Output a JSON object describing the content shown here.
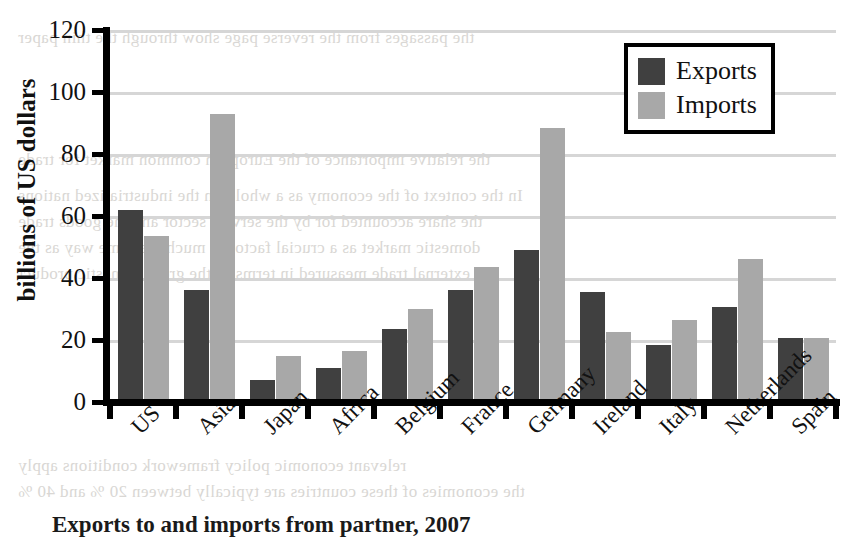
{
  "chart_data": {
    "type": "bar",
    "title": "",
    "xlabel": "",
    "ylabel": "billions of US dollars",
    "ylim": [
      0,
      120
    ],
    "yticks": [
      0,
      20,
      40,
      60,
      80,
      100,
      120
    ],
    "ytick_labels": [
      "0",
      "20",
      "40",
      "60",
      "80",
      "100",
      "120"
    ],
    "grid": true,
    "legend_position": "top-right",
    "categories": [
      "US",
      "Asia",
      "Japan",
      "Africa",
      "Belgium",
      "France",
      "Germany",
      "Ireland",
      "Italy",
      "Netherlands",
      "Spain"
    ],
    "series": [
      {
        "name": "Exports",
        "color": "#404040",
        "values": [
          62,
          36,
          7,
          11,
          23.5,
          36,
          49,
          35.5,
          18.5,
          30.5,
          20.5
        ]
      },
      {
        "name": "Imports",
        "color": "#a8a8a8",
        "values": [
          53.5,
          93,
          15,
          16.5,
          30,
          43.5,
          88.5,
          22.5,
          26.5,
          46,
          20.5
        ]
      }
    ]
  },
  "legend": {
    "entries": [
      {
        "label": "Exports",
        "swatch": "exports"
      },
      {
        "label": "Imports",
        "swatch": "imports"
      }
    ]
  },
  "caption": {
    "text": "Exports to and imports from partner, 2007"
  },
  "colors": {
    "exports": "#404040",
    "imports": "#a8a8a8",
    "gridline": "#d6d6d6",
    "axis": "#000000",
    "page_background": "#ffffff"
  },
  "bleed_text": [
    "the passages from the reverse page show through the thin paper",
    "In the context of the economy as a whole, in the industrialized nations",
    "the share accounted for by the service sector and the goods trade",
    "domestic market as a crucial factor in much the same way as the",
    "external trade measured in terms of the gross domestic product",
    "relevant economic policy framework conditions apply",
    "the economies of these countries are typically between 20 % and 40 %",
    "the relative importance of the European common market for trade"
  ]
}
